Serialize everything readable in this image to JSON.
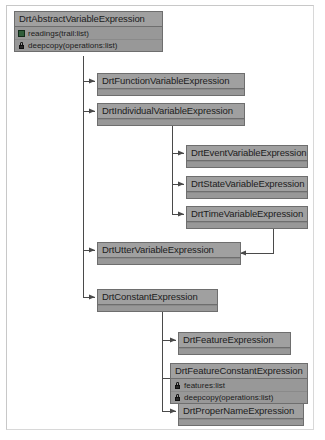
{
  "diagram": {
    "type": "uml-class-inheritance",
    "colors": {
      "box_fill": "#9c9c9c",
      "box_border": "#6e6e6e",
      "header_fill": "#a0a0a0",
      "body_fill": "#989898",
      "connector": "#4a4a4a",
      "page_border": "#c8c8c8",
      "background": "#ffffff",
      "public_icon": "#2f5d3a",
      "private_icon": "#2a2a2a"
    },
    "classes": [
      {
        "id": "abstract-variable-expression",
        "name": "DrtAbstractVariableExpression",
        "members": [
          {
            "visibility": "public",
            "icon": "public-square-icon",
            "text": "readings(trail:list)"
          },
          {
            "visibility": "private",
            "icon": "lock-icon",
            "text": "deepcopy(operations:list)"
          }
        ]
      },
      {
        "id": "function-variable-expression",
        "name": "DrtFunctionVariableExpression",
        "members": []
      },
      {
        "id": "individual-variable-expression",
        "name": "DrtIndividualVariableExpression",
        "members": []
      },
      {
        "id": "event-variable-expression",
        "name": "DrtEventVariableExpression",
        "members": []
      },
      {
        "id": "state-variable-expression",
        "name": "DrtStateVariableExpression",
        "members": []
      },
      {
        "id": "time-variable-expression",
        "name": "DrtTimeVariableExpression",
        "members": []
      },
      {
        "id": "utter-variable-expression",
        "name": "DrtUtterVariableExpression",
        "members": []
      },
      {
        "id": "constant-expression",
        "name": "DrtConstantExpression",
        "members": []
      },
      {
        "id": "feature-expression",
        "name": "DrtFeatureExpression",
        "members": []
      },
      {
        "id": "feature-constant-expression",
        "name": "DrtFeatureConstantExpression",
        "members": [
          {
            "visibility": "private",
            "icon": "lock-icon",
            "text": "features:list"
          },
          {
            "visibility": "private",
            "icon": "lock-icon",
            "text": "deepcopy(operations:list)"
          }
        ]
      },
      {
        "id": "proper-name-expression",
        "name": "DrtProperNameExpression",
        "members": []
      }
    ],
    "relations": [
      {
        "from": "abstract-variable-expression",
        "to": "function-variable-expression",
        "kind": "generalization"
      },
      {
        "from": "abstract-variable-expression",
        "to": "individual-variable-expression",
        "kind": "generalization"
      },
      {
        "from": "abstract-variable-expression",
        "to": "utter-variable-expression",
        "kind": "generalization"
      },
      {
        "from": "abstract-variable-expression",
        "to": "constant-expression",
        "kind": "generalization"
      },
      {
        "from": "individual-variable-expression",
        "to": "event-variable-expression",
        "kind": "generalization"
      },
      {
        "from": "individual-variable-expression",
        "to": "state-variable-expression",
        "kind": "generalization"
      },
      {
        "from": "individual-variable-expression",
        "to": "time-variable-expression",
        "kind": "generalization"
      },
      {
        "from": "time-variable-expression",
        "to": "utter-variable-expression",
        "kind": "generalization"
      },
      {
        "from": "constant-expression",
        "to": "feature-expression",
        "kind": "generalization"
      },
      {
        "from": "constant-expression",
        "to": "feature-constant-expression",
        "kind": "generalization"
      },
      {
        "from": "constant-expression",
        "to": "proper-name-expression",
        "kind": "generalization"
      }
    ]
  }
}
